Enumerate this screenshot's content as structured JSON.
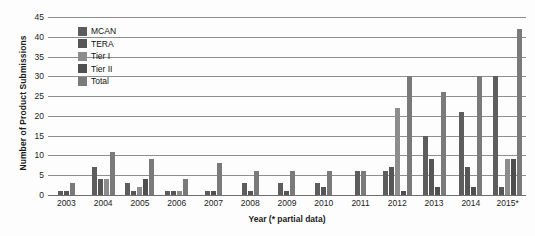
{
  "chart_data": {
    "type": "bar",
    "title": "",
    "xlabel": "Year (* partial data)",
    "ylabel": "Number of Product Submissions",
    "ylim": [
      0,
      45
    ],
    "ytick_step": 5,
    "yticks": [
      45,
      40,
      35,
      30,
      25,
      20,
      15,
      10,
      5,
      0
    ],
    "grid": true,
    "legend_position": "top-left",
    "categories": [
      "2003",
      "2004",
      "2005",
      "2006",
      "2007",
      "2008",
      "2009",
      "2010",
      "2011",
      "2012",
      "2013",
      "2014",
      "2015*"
    ],
    "series": [
      {
        "name": "MCAN",
        "color": "#5d5d5d",
        "values": [
          1,
          7,
          3,
          1,
          1,
          3,
          3,
          3,
          6,
          6,
          15,
          21,
          30
        ]
      },
      {
        "name": "TERA",
        "color": "#565656",
        "values": [
          1,
          4,
          1,
          1,
          0,
          1,
          1,
          2,
          0,
          7,
          9,
          7,
          2
        ]
      },
      {
        "name": "Tier I",
        "color": "#8c8c8c",
        "values": [
          0,
          4,
          2,
          1,
          0,
          0,
          0,
          0,
          0,
          0,
          0,
          0,
          9
        ]
      },
      {
        "name": "Tier II",
        "color": "#4f4f4f",
        "values": [
          0,
          0,
          4,
          6,
          1,
          0,
          0,
          0,
          0,
          1,
          2,
          2,
          9
        ]
      },
      {
        "name": "Total",
        "color": "#7a7a7a",
        "values": [
          3,
          11,
          9,
          4,
          8,
          6,
          6,
          6,
          7,
          22,
          30,
          26,
          42
        ]
      }
    ],
    "series_order_note": "grouped bars, one cluster per year",
    "groups": [
      {
        "year": "2003",
        "bars": [
          {
            "series": "MCAN",
            "value": 1
          },
          {
            "series": "TERA",
            "value": 1
          },
          {
            "series": "Total",
            "value": 3
          }
        ]
      },
      {
        "year": "2004",
        "bars": [
          {
            "series": "MCAN",
            "value": 7
          },
          {
            "series": "TERA",
            "value": 4
          },
          {
            "series": "Tier I",
            "value": 4
          },
          {
            "series": "Total",
            "value": 11
          }
        ]
      },
      {
        "year": "2005",
        "bars": [
          {
            "series": "MCAN",
            "value": 3
          },
          {
            "series": "TERA",
            "value": 1
          },
          {
            "series": "Tier I",
            "value": 2
          },
          {
            "series": "Tier II",
            "value": 4
          },
          {
            "series": "Total",
            "value": 9
          }
        ]
      },
      {
        "year": "2006",
        "bars": [
          {
            "series": "MCAN",
            "value": 1
          },
          {
            "series": "TERA",
            "value": 1
          },
          {
            "series": "Tier I",
            "value": 1
          },
          {
            "series": "Total",
            "value": 4
          }
        ]
      },
      {
        "year": "2007",
        "bars": [
          {
            "series": "MCAN",
            "value": 1
          },
          {
            "series": "Tier II",
            "value": 1
          },
          {
            "series": "Total",
            "value": 8
          }
        ]
      },
      {
        "year": "2008",
        "bars": [
          {
            "series": "MCAN",
            "value": 3
          },
          {
            "series": "TERA",
            "value": 1
          },
          {
            "series": "Total",
            "value": 6
          }
        ]
      },
      {
        "year": "2009",
        "bars": [
          {
            "series": "MCAN",
            "value": 3
          },
          {
            "series": "TERA",
            "value": 1
          },
          {
            "series": "Total",
            "value": 6
          }
        ]
      },
      {
        "year": "2010",
        "bars": [
          {
            "series": "MCAN",
            "value": 3
          },
          {
            "series": "TERA",
            "value": 2
          },
          {
            "series": "Total",
            "value": 6
          }
        ]
      },
      {
        "year": "2011",
        "bars": [
          {
            "series": "MCAN",
            "value": 6
          },
          {
            "series": "Total",
            "value": 6
          }
        ]
      },
      {
        "year": "2012",
        "bars": [
          {
            "series": "MCAN",
            "value": 6
          },
          {
            "series": "TERA",
            "value": 7
          },
          {
            "series": "Tier I",
            "value": 22
          },
          {
            "series": "Tier II",
            "value": 1
          },
          {
            "series": "Total",
            "value": 30
          }
        ]
      },
      {
        "year": "2013",
        "bars": [
          {
            "series": "MCAN",
            "value": 15
          },
          {
            "series": "TERA",
            "value": 9
          },
          {
            "series": "Tier II",
            "value": 2
          },
          {
            "series": "Total",
            "value": 26
          }
        ]
      },
      {
        "year": "2014",
        "bars": [
          {
            "series": "MCAN",
            "value": 21
          },
          {
            "series": "TERA",
            "value": 7
          },
          {
            "series": "Tier II",
            "value": 2
          },
          {
            "series": "Total",
            "value": 30
          }
        ]
      },
      {
        "year": "2015*",
        "bars": [
          {
            "series": "MCAN",
            "value": 30
          },
          {
            "series": "TERA",
            "value": 2
          },
          {
            "series": "Tier I",
            "value": 9
          },
          {
            "series": "Tier II",
            "value": 9
          },
          {
            "series": "Total",
            "value": 42
          }
        ]
      }
    ]
  },
  "legend": {
    "items": [
      {
        "label": "MCAN",
        "color": "#5d5d5d"
      },
      {
        "label": "TERA",
        "color": "#565656"
      },
      {
        "label": "Tier I",
        "color": "#8c8c8c"
      },
      {
        "label": "Tier II",
        "color": "#4f4f4f"
      },
      {
        "label": "Total",
        "color": "#7a7a7a"
      }
    ]
  },
  "colors": {
    "gridline": "#8e8e8e",
    "axis_text": "#1c1c1c",
    "background": "#fdfdfd"
  }
}
